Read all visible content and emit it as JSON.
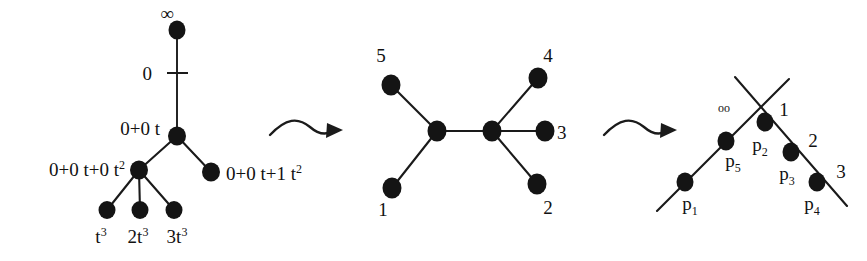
{
  "figure": {
    "background_color": "#ffffff",
    "ink_color": "#141414",
    "width": 867,
    "height": 261
  },
  "panel_left": {
    "name": "rooted-tree-with-polynomial-labels",
    "labels": {
      "root": "∞",
      "root_edge": "0",
      "level1": "0+0 t",
      "level2_left": "0+0 t+0 t²",
      "level2_right": "0+0 t+1 t²",
      "leaf1": "t³",
      "leaf2": "2t³",
      "leaf3": "3t³"
    },
    "label_parts": {
      "level2_left_base": "0+0 t+0 t",
      "level2_left_exp": "2",
      "level2_right_base": "0+0 t+1 t",
      "level2_right_exp": "2",
      "leaf1_base": "t",
      "leaf1_exp": "3",
      "leaf2_base": "2t",
      "leaf2_exp": "3",
      "leaf3_base": "3t",
      "leaf3_exp": "3"
    },
    "nodes": [
      {
        "id": "root",
        "cx": 177,
        "cy": 30,
        "rx": 8.5,
        "ry": 9.5
      },
      {
        "id": "v1",
        "cx": 177,
        "cy": 136,
        "rx": 9.0,
        "ry": 9.5
      },
      {
        "id": "v2",
        "cx": 139,
        "cy": 170,
        "rx": 9.0,
        "ry": 9.5
      },
      {
        "id": "v3",
        "cx": 211,
        "cy": 172,
        "rx": 9.0,
        "ry": 9.5
      },
      {
        "id": "l1",
        "cx": 107,
        "cy": 210,
        "rx": 8.5,
        "ry": 9.0
      },
      {
        "id": "l2",
        "cx": 140,
        "cy": 210,
        "rx": 8.5,
        "ry": 9.0
      },
      {
        "id": "l3",
        "cx": 174,
        "cy": 210,
        "rx": 8.5,
        "ry": 9.0
      }
    ],
    "edges": [
      {
        "from": "root",
        "to": "v1"
      },
      {
        "from": "v1",
        "to": "v2"
      },
      {
        "from": "v1",
        "to": "v3"
      },
      {
        "from": "v2",
        "to": "l1"
      },
      {
        "from": "v2",
        "to": "l2"
      },
      {
        "from": "v2",
        "to": "l3"
      }
    ]
  },
  "panel_middle": {
    "name": "unrooted-labelled-tree",
    "leaf_labels": [
      "1",
      "2",
      "3",
      "4",
      "5"
    ],
    "nodes": [
      {
        "id": "n5",
        "cx": 391,
        "cy": 85,
        "rx": 9.5,
        "ry": 10.5
      },
      {
        "id": "n1",
        "cx": 392,
        "cy": 188,
        "rx": 9.5,
        "ry": 10.5
      },
      {
        "id": "c1",
        "cx": 437,
        "cy": 131,
        "rx": 9.5,
        "ry": 10.5
      },
      {
        "id": "c2",
        "cx": 492,
        "cy": 131,
        "rx": 9.5,
        "ry": 10.5
      },
      {
        "id": "n4",
        "cx": 538,
        "cy": 78,
        "rx": 9.5,
        "ry": 10.5
      },
      {
        "id": "n3",
        "cx": 545,
        "cy": 131,
        "rx": 9.5,
        "ry": 10.5
      },
      {
        "id": "n2",
        "cx": 537,
        "cy": 184,
        "rx": 9.5,
        "ry": 10.5
      }
    ],
    "edges": [
      {
        "from": "n5",
        "to": "c1"
      },
      {
        "from": "n1",
        "to": "c1"
      },
      {
        "from": "c1",
        "to": "c2"
      },
      {
        "from": "c2",
        "to": "n4"
      },
      {
        "from": "c2",
        "to": "n3"
      },
      {
        "from": "c2",
        "to": "n2"
      }
    ],
    "label_positions": [
      {
        "text": "5",
        "x": 381,
        "y": 60
      },
      {
        "text": "4",
        "x": 546,
        "y": 60
      },
      {
        "text": "3",
        "x": 558,
        "y": 139
      },
      {
        "text": "2",
        "x": 546,
        "y": 212
      },
      {
        "text": "1",
        "x": 383,
        "y": 214
      }
    ]
  },
  "panel_right": {
    "name": "tropical-line-arrangement",
    "point_labels": [
      "p",
      "p",
      "p",
      "p",
      "p"
    ],
    "point_subscripts": [
      "1",
      "2",
      "3",
      "4",
      "5"
    ],
    "line_labels": [
      "1",
      "2",
      "3"
    ],
    "infinity_label": "oo",
    "nodes": [
      {
        "id": "p1",
        "cx": 685,
        "cy": 179,
        "rx": 8.5,
        "ry": 9.5
      },
      {
        "id": "p5",
        "cx": 726,
        "cy": 134,
        "rx": 8.5,
        "ry": 9.5
      },
      {
        "id": "p2",
        "cx": 766,
        "cy": 124,
        "rx": 8.5,
        "ry": 9.5
      },
      {
        "id": "p3",
        "cx": 791,
        "cy": 154,
        "rx": 8.5,
        "ry": 9.5
      },
      {
        "id": "p4",
        "cx": 818,
        "cy": 182,
        "rx": 8.5,
        "ry": 9.5
      }
    ],
    "strokes": [
      {
        "id": "rising-line",
        "x1": 657,
        "y1": 210,
        "x2": 788,
        "y2": 80
      },
      {
        "id": "falling-line",
        "x1": 736,
        "y1": 78,
        "x2": 846,
        "y2": 205
      }
    ],
    "label_positions": [
      {
        "text": "oo",
        "x": 724,
        "y": 109,
        "cls": "lbl-tiny"
      },
      {
        "text": "1",
        "x": 784,
        "y": 116,
        "cls": "lbl"
      },
      {
        "text": "2",
        "x": 812,
        "y": 146,
        "cls": "lbl"
      },
      {
        "text": "3",
        "x": 840,
        "y": 177,
        "cls": "lbl"
      }
    ]
  },
  "arrows": [
    {
      "name": "arrow-left-to-middle",
      "x": 268,
      "y": 125
    },
    {
      "name": "arrow-middle-to-right",
      "x": 604,
      "y": 125
    }
  ]
}
